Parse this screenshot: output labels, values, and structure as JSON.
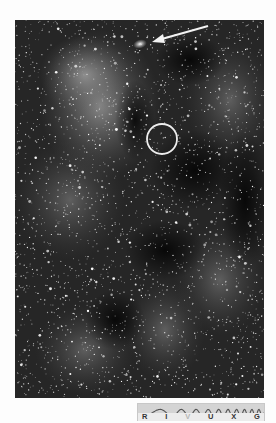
{
  "figure": {
    "type": "astronomical-photograph",
    "annotations": {
      "arrow": {
        "color": "#f2f2f2",
        "from": [
          193,
          6
        ],
        "to": [
          139,
          21
        ]
      },
      "circle": {
        "color": "#eeeeee",
        "center": [
          147,
          119
        ],
        "radius": 15
      },
      "highlight_blob": {
        "center": [
          125,
          24
        ]
      }
    }
  },
  "spectrum_bar": {
    "labels": [
      "R",
      "I",
      "V",
      "U",
      "X",
      "G"
    ],
    "active_band": "V",
    "colors": {
      "background": "#e6e6e6",
      "wave": "#555555",
      "label": "#333333",
      "active_label": "#b5b5b5"
    }
  }
}
